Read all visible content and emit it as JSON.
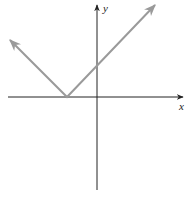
{
  "chart_data": {
    "type": "line",
    "title": "",
    "xlabel": "x",
    "ylabel": "y",
    "grid": false,
    "legend": null,
    "series": [
      {
        "name": "absolute-value-graph",
        "color": "#9a9a9a",
        "vertex": {
          "x": -1,
          "y": 0
        },
        "slope_left": -1,
        "slope_right": 1,
        "x": [
          -3,
          -1,
          3.5
        ],
        "y": [
          1.9,
          0,
          4.5
        ],
        "arrows": [
          "left-end",
          "right-end"
        ]
      }
    ],
    "pixel_geometry": {
      "origin": [
        97,
        97
      ],
      "vertex": [
        67,
        97
      ],
      "left_arrow_tip": [
        10,
        40
      ],
      "right_arrow_tip": [
        155,
        5
      ],
      "x_axis": {
        "x1": 8,
        "x2": 183,
        "y": 97
      },
      "y_axis": {
        "x": 97,
        "y1": 5,
        "y2": 190
      }
    },
    "axis_color": "#222222",
    "curve_color": "#9a9a9a"
  },
  "labels": {
    "x_axis": "x",
    "y_axis": "y"
  }
}
